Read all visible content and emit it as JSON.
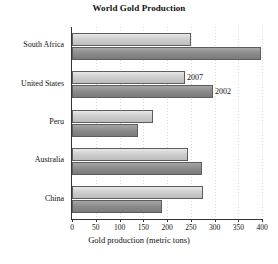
{
  "chart_data": {
    "type": "bar",
    "orientation": "horizontal",
    "title": "World Gold Production",
    "xlabel": "Gold production (metric tons)",
    "ylabel": "",
    "categories": [
      "South Africa",
      "United States",
      "Peru",
      "Australia",
      "China"
    ],
    "series": [
      {
        "name": "2007",
        "values": [
          250,
          238,
          170,
          245,
          275
        ],
        "color": "#cfcfcf"
      },
      {
        "name": "2002",
        "values": [
          398,
          297,
          138,
          273,
          190
        ],
        "color": "#8d8d8d"
      }
    ],
    "xlim": [
      0,
      400
    ],
    "xticks": [
      0,
      50,
      100,
      150,
      200,
      250,
      300,
      350,
      400
    ],
    "xtick_labels": [
      "0",
      "50",
      "100",
      "150",
      "200",
      "250",
      "300",
      "350",
      "400"
    ],
    "grid": "vertical-dotted",
    "legend": "inline-annotations",
    "annotations": [
      {
        "text": "2007",
        "category": "United States",
        "series": "2007"
      },
      {
        "text": "2002",
        "category": "United States",
        "series": "2002"
      }
    ]
  }
}
